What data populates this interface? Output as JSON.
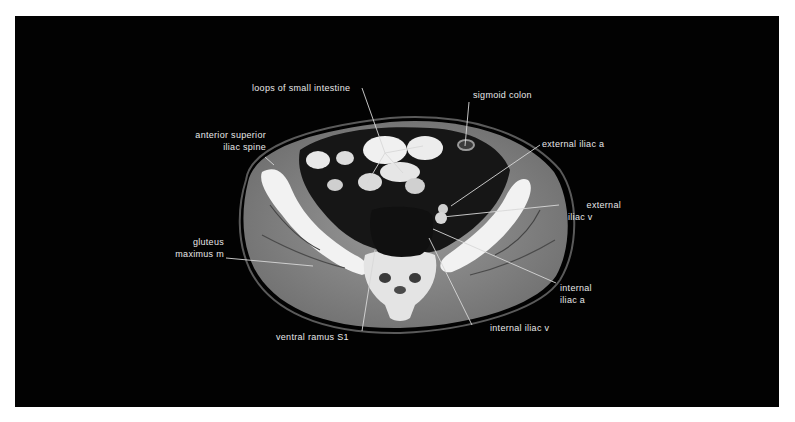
{
  "figure": {
    "type": "axial CT scan of pelvis",
    "background_color": "#020202",
    "label_color": "#e8e8e8"
  },
  "labels": {
    "loops_small_intestine": "loops of small intestine",
    "sigmoid_colon": "sigmoid colon",
    "anterior_superior_line1": "anterior superior",
    "anterior_superior_line2": "iliac spine",
    "external_iliac_a": "external iliac a",
    "external_iliac_v_line1": "external",
    "external_iliac_v_line2": "iliac v",
    "gluteus_line1": "gluteus",
    "gluteus_line2": "maximus m",
    "internal_iliac_a_line1": "internal",
    "internal_iliac_a_line2": "iliac a",
    "internal_iliac_v": "internal iliac v",
    "ventral_ramus": "ventral ramus S1"
  }
}
